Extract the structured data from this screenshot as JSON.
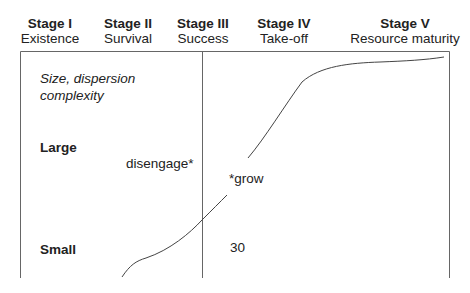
{
  "stages": [
    {
      "title": "Stage I",
      "subtitle": "Existence"
    },
    {
      "title": "Stage II",
      "subtitle": "Survival"
    },
    {
      "title": "Stage III",
      "subtitle": "Success"
    },
    {
      "title": "Stage IV",
      "subtitle": "Take-off"
    },
    {
      "title": "Stage V",
      "subtitle": "Resource maturity"
    }
  ],
  "axis": {
    "label_line1": "Size, dispersion",
    "label_line2": "complexity",
    "large": "Large",
    "small": "Small"
  },
  "annotations": {
    "disengage": "disengage*",
    "grow": "*grow",
    "number": "30"
  },
  "colors": {
    "line": "#555555",
    "text": "#222222"
  }
}
